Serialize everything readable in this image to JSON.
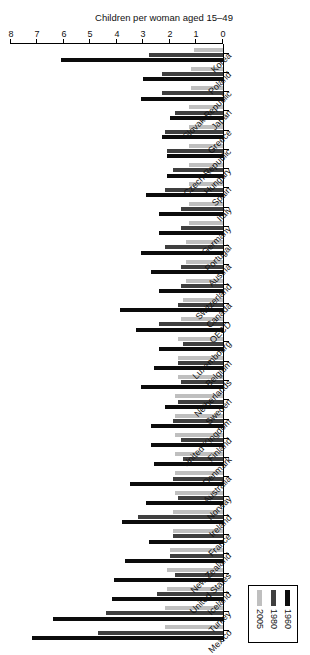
{
  "chart_data": {
    "type": "bar",
    "orientation": "horizontal",
    "title": "",
    "xlabel": "Children per woman aged 15–49",
    "ylabel": "",
    "xlim": [
      0,
      8
    ],
    "xticks": [
      0,
      1,
      2,
      3,
      4,
      5,
      6,
      7,
      8
    ],
    "grid": false,
    "legend_position": "top-left",
    "legend_entries": [
      "1960",
      "1980",
      "2005"
    ],
    "series_colors": [
      "#0c0c0c",
      "#3f3f3f",
      "#bfbfbf"
    ],
    "categories": [
      "Mexico",
      "Turkey",
      "Iceland",
      "United States",
      "New Zealand",
      "France",
      "Ireland",
      "Norway",
      "Australia",
      "Denmark",
      "Finland",
      "United Kingdom",
      "Sweden",
      "Netherlands",
      "Belgium",
      "Luxembourg",
      "OECD",
      "Canada",
      "Switzerland",
      "Austria",
      "Portugal",
      "Germany",
      "Italy",
      "Spain",
      "Hungary",
      "Czech Republic",
      "Greece",
      "Japan",
      "Slovak Republic",
      "Poland",
      "Korea"
    ],
    "series": [
      {
        "name": "1960",
        "values": [
          7.2,
          6.4,
          4.2,
          4.1,
          3.7,
          2.8,
          3.8,
          2.9,
          3.5,
          2.6,
          2.7,
          2.7,
          2.2,
          3.1,
          2.6,
          2.4,
          3.3,
          3.9,
          2.4,
          2.7,
          3.1,
          2.4,
          2.4,
          2.9,
          2.1,
          2.1,
          2.3,
          2.0,
          3.1,
          3.0,
          6.1
        ]
      },
      {
        "name": "1980",
        "values": [
          4.7,
          4.4,
          2.5,
          1.8,
          2.0,
          1.9,
          3.2,
          1.7,
          1.9,
          1.5,
          1.6,
          1.9,
          1.7,
          1.6,
          1.7,
          1.5,
          2.4,
          1.7,
          1.6,
          1.6,
          2.2,
          1.6,
          1.6,
          2.2,
          1.9,
          2.1,
          2.2,
          1.8,
          2.3,
          2.3,
          2.8
        ]
      },
      {
        "name": "2005",
        "values": [
          2.2,
          2.2,
          2.1,
          2.1,
          2.0,
          1.9,
          1.9,
          1.8,
          1.8,
          1.8,
          1.8,
          1.8,
          1.8,
          1.7,
          1.7,
          1.7,
          1.6,
          1.5,
          1.4,
          1.4,
          1.4,
          1.3,
          1.3,
          1.3,
          1.3,
          1.3,
          1.3,
          1.3,
          1.2,
          1.2,
          1.1
        ]
      }
    ]
  },
  "axis": {
    "value_axis_title": "Children per woman aged 15–49",
    "tick_labels": [
      "0",
      "1",
      "2",
      "3",
      "4",
      "5",
      "6",
      "7",
      "8"
    ]
  },
  "legend": {
    "items": [
      {
        "label": "1960",
        "color": "#0c0c0c"
      },
      {
        "label": "1980",
        "color": "#3f3f3f"
      },
      {
        "label": "2005",
        "color": "#bfbfbf"
      }
    ]
  }
}
